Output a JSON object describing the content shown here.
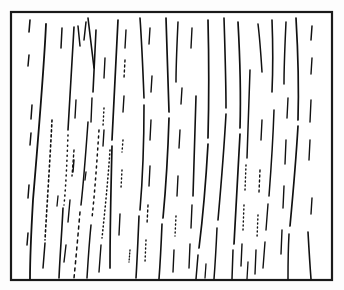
{
  "figure": {
    "kind": "line-drawing",
    "background_color": "#ffffff",
    "ink_color": "#111111",
    "frame_color": "#1a1a1a",
    "canvas": {
      "width": 344,
      "height": 290
    },
    "frame": {
      "x": 11,
      "y": 12,
      "width": 321,
      "height": 268,
      "stroke_width": 2.2
    },
    "stroke_count": 78,
    "caption": "",
    "labels": [],
    "axes": []
  },
  "chart_data": {
    "type": "line",
    "xlabel": "",
    "ylabel": "",
    "xlim": [
      11,
      332
    ],
    "ylim": [
      12,
      280
    ],
    "grid": false,
    "legend": "none",
    "strokes": [
      {
        "d": "M 30 20 L 29 32",
        "w": 1.6,
        "dash": "none"
      },
      {
        "d": "M 29 55 L 28 66",
        "w": 1.5,
        "dash": "none"
      },
      {
        "d": "M 32 105 L 31 119",
        "w": 1.5,
        "dash": "none"
      },
      {
        "d": "M 31 133 L 30 145",
        "w": 1.5,
        "dash": "none"
      },
      {
        "d": "M 29 185 L 28 198",
        "w": 1.5,
        "dash": "none"
      },
      {
        "d": "M 28 233 L 27 245",
        "w": 1.5,
        "dash": "none"
      },
      {
        "d": "M 46 24 C 44 70 38 140 33 200 C 31 235 30 262 30 279",
        "w": 1.8,
        "dash": "none"
      },
      {
        "d": "M 52 120 C 50 160 47 205 45 240",
        "w": 1.6,
        "dash": "2 3"
      },
      {
        "d": "M 45 243 L 43 268",
        "w": 1.5,
        "dash": "none"
      },
      {
        "d": "M 62 28 L 61 48",
        "w": 1.5,
        "dash": "none"
      },
      {
        "d": "M 74 27 C 72 60 70 95 68 130",
        "w": 1.6,
        "dash": "none"
      },
      {
        "d": "M 68 135 C 67 160 66 185 64 205",
        "w": 1.5,
        "dash": "1 4"
      },
      {
        "d": "M 63 208 C 62 230 60 255 59 278",
        "w": 1.6,
        "dash": "none"
      },
      {
        "d": "M 76 100 L 75 118",
        "w": 1.4,
        "dash": "none"
      },
      {
        "d": "M 74 150 L 72 176",
        "w": 1.4,
        "dash": "2 3"
      },
      {
        "d": "M 70 200 L 68 222",
        "w": 1.4,
        "dash": "none"
      },
      {
        "d": "M 66 245 L 64 262",
        "w": 1.4,
        "dash": "none"
      },
      {
        "d": "M 86 22 L 84 40",
        "w": 1.5,
        "dash": "none"
      },
      {
        "d": "M 88 122 C 86 150 84 178 81 205",
        "w": 1.5,
        "dash": "none"
      },
      {
        "d": "M 80 212 C 78 235 76 258 74 278",
        "w": 1.5,
        "dash": "3 4"
      },
      {
        "d": "M 96 30 C 95 52 94 74 93 92",
        "w": 1.6,
        "dash": "none"
      },
      {
        "d": "M 92 98 L 91 122",
        "w": 1.4,
        "dash": "none"
      },
      {
        "d": "M 99 130 C 97 160 95 190 92 218",
        "w": 1.5,
        "dash": "2 4"
      },
      {
        "d": "M 91 225 C 89 245 88 262 87 278",
        "w": 1.5,
        "dash": "none"
      },
      {
        "d": "M 105 58 L 104 78",
        "w": 1.4,
        "dash": "none"
      },
      {
        "d": "M 104 108 L 103 126",
        "w": 1.4,
        "dash": "1 3"
      },
      {
        "d": "M 110 150 C 108 180 105 210 102 238",
        "w": 1.5,
        "dash": "1 3"
      },
      {
        "d": "M 101 245 L 99 272",
        "w": 1.4,
        "dash": "none"
      },
      {
        "d": "M 74 160 L 73 172",
        "w": 1.4,
        "dash": "none"
      },
      {
        "d": "M 78 26 L 80 46",
        "w": 1.5,
        "dash": "none"
      },
      {
        "d": "M 88 18 C 90 35 92 52 94 68",
        "w": 1.6,
        "dash": "none"
      },
      {
        "d": "M 104 130 L 103 146",
        "w": 1.4,
        "dash": "none"
      },
      {
        "d": "M 118 20 C 116 60 114 100 112 140",
        "w": 1.7,
        "dash": "none"
      },
      {
        "d": "M 112 146 C 111 186 110 226 110 268",
        "w": 1.7,
        "dash": "none"
      },
      {
        "d": "M 126 30 L 125 48",
        "w": 1.4,
        "dash": "none"
      },
      {
        "d": "M 125 60 L 124 78",
        "w": 1.4,
        "dash": "2 3"
      },
      {
        "d": "M 124 96 L 123 112",
        "w": 1.4,
        "dash": "none"
      },
      {
        "d": "M 123 140 L 122 152",
        "w": 1.4,
        "dash": "1 3"
      },
      {
        "d": "M 122 170 L 121 188",
        "w": 1.4,
        "dash": "1 3"
      },
      {
        "d": "M 120 214 L 119 235",
        "w": 1.4,
        "dash": "none"
      },
      {
        "d": "M 140 18 C 142 46 143 72 144 98",
        "w": 1.6,
        "dash": "none"
      },
      {
        "d": "M 144 105 C 144 140 143 175 140 210",
        "w": 1.6,
        "dash": "none"
      },
      {
        "d": "M 139 216 C 138 240 137 262 136 278",
        "w": 1.6,
        "dash": "none"
      },
      {
        "d": "M 150 28 L 149 44",
        "w": 1.4,
        "dash": "none"
      },
      {
        "d": "M 152 76 L 151 92",
        "w": 1.4,
        "dash": "none"
      },
      {
        "d": "M 151 120 L 150 140",
        "w": 1.4,
        "dash": "none"
      },
      {
        "d": "M 150 166 L 149 186",
        "w": 1.4,
        "dash": "none"
      },
      {
        "d": "M 148 205 L 147 224",
        "w": 1.4,
        "dash": "2 3"
      },
      {
        "d": "M 146 240 L 145 262",
        "w": 1.4,
        "dash": "1 3"
      },
      {
        "d": "M 166 18 C 167 50 168 82 169 112",
        "w": 1.7,
        "dash": "none"
      },
      {
        "d": "M 169 118 C 168 152 166 186 163 218",
        "w": 1.7,
        "dash": "none"
      },
      {
        "d": "M 162 224 C 161 248 160 266 159 279",
        "w": 1.6,
        "dash": "none"
      },
      {
        "d": "M 178 22 C 177 44 176 64 176 82",
        "w": 1.5,
        "dash": "none"
      },
      {
        "d": "M 182 88 L 181 104",
        "w": 1.4,
        "dash": "none"
      },
      {
        "d": "M 180 130 L 179 148",
        "w": 1.4,
        "dash": "none"
      },
      {
        "d": "M 178 176 L 177 196",
        "w": 1.4,
        "dash": "none"
      },
      {
        "d": "M 176 216 L 175 236",
        "w": 1.4,
        "dash": "1 3"
      },
      {
        "d": "M 174 250 L 173 272",
        "w": 1.4,
        "dash": "none"
      },
      {
        "d": "M 192 28 L 191 48",
        "w": 1.4,
        "dash": "none"
      },
      {
        "d": "M 196 96 C 195 130 194 164 193 196",
        "w": 1.6,
        "dash": "none"
      },
      {
        "d": "M 192 205 L 191 228",
        "w": 1.4,
        "dash": "none"
      },
      {
        "d": "M 190 244 L 189 268",
        "w": 1.4,
        "dash": "none"
      },
      {
        "d": "M 208 20 C 209 60 209 100 208 138",
        "w": 1.7,
        "dash": "none"
      },
      {
        "d": "M 208 144 C 206 180 203 216 199 248",
        "w": 1.7,
        "dash": "none"
      },
      {
        "d": "M 198 255 L 196 279",
        "w": 1.5,
        "dash": "none"
      },
      {
        "d": "M 224 18 C 225 50 226 80 226 108",
        "w": 1.6,
        "dash": "none"
      },
      {
        "d": "M 226 114 C 224 150 221 186 218 220",
        "w": 1.6,
        "dash": "none"
      },
      {
        "d": "M 217 228 C 216 250 215 266 214 279",
        "w": 1.5,
        "dash": "none"
      },
      {
        "d": "M 238 22 C 240 58 241 94 240 128",
        "w": 1.7,
        "dash": "none"
      },
      {
        "d": "M 240 134 C 238 172 236 210 234 244",
        "w": 1.7,
        "dash": "none"
      },
      {
        "d": "M 233 250 L 232 279",
        "w": 1.5,
        "dash": "none"
      },
      {
        "d": "M 250 70 C 249 100 248 130 247 158",
        "w": 1.5,
        "dash": "none"
      },
      {
        "d": "M 246 165 L 245 190",
        "w": 1.4,
        "dash": "1 3"
      },
      {
        "d": "M 244 205 L 243 230",
        "w": 1.4,
        "dash": "1 3"
      },
      {
        "d": "M 242 244 L 241 266",
        "w": 1.4,
        "dash": "none"
      },
      {
        "d": "M 258 24 C 260 40 261 56 262 72",
        "w": 1.5,
        "dash": "none"
      },
      {
        "d": "M 262 120 L 261 140",
        "w": 1.4,
        "dash": "none"
      },
      {
        "d": "M 260 170 L 259 192",
        "w": 1.4,
        "dash": "2 3"
      },
      {
        "d": "M 258 215 L 257 238",
        "w": 1.4,
        "dash": "1 3"
      },
      {
        "d": "M 256 250 L 255 274",
        "w": 1.4,
        "dash": "none"
      },
      {
        "d": "M 272 20 C 273 46 273 70 272 92",
        "w": 1.6,
        "dash": "none"
      },
      {
        "d": "M 274 110 C 273 140 271 170 269 196",
        "w": 1.5,
        "dash": "none"
      },
      {
        "d": "M 268 204 L 266 230",
        "w": 1.4,
        "dash": "none"
      },
      {
        "d": "M 265 242 L 263 268",
        "w": 1.4,
        "dash": "none"
      },
      {
        "d": "M 286 22 C 285 44 284 64 284 84",
        "w": 1.5,
        "dash": "none"
      },
      {
        "d": "M 288 98 L 287 118",
        "w": 1.4,
        "dash": "none"
      },
      {
        "d": "M 286 140 L 285 164",
        "w": 1.4,
        "dash": "none"
      },
      {
        "d": "M 284 186 L 283 208",
        "w": 1.4,
        "dash": "none"
      },
      {
        "d": "M 282 230 L 281 254",
        "w": 1.4,
        "dash": "none"
      },
      {
        "d": "M 296 18 C 298 52 299 86 298 120",
        "w": 1.7,
        "dash": "none"
      },
      {
        "d": "M 298 126 C 296 160 293 194 290 226",
        "w": 1.7,
        "dash": "none"
      },
      {
        "d": "M 289 234 C 288 252 288 266 288 279",
        "w": 1.5,
        "dash": "none"
      },
      {
        "d": "M 312 26 L 311 40",
        "w": 1.5,
        "dash": "none"
      },
      {
        "d": "M 312 58 L 311 74",
        "w": 1.4,
        "dash": "none"
      },
      {
        "d": "M 311 100 L 310 122",
        "w": 1.4,
        "dash": "none"
      },
      {
        "d": "M 310 140 L 309 160",
        "w": 1.4,
        "dash": "none"
      },
      {
        "d": "M 312 198 L 311 214",
        "w": 1.4,
        "dash": "none"
      },
      {
        "d": "M 308 232 C 309 250 310 266 311 279",
        "w": 1.6,
        "dash": "none"
      },
      {
        "d": "M 58 196 L 57 206",
        "w": 1.3,
        "dash": "none"
      },
      {
        "d": "M 86 172 L 85 180",
        "w": 1.3,
        "dash": "none"
      },
      {
        "d": "M 130 250 L 129 262",
        "w": 1.3,
        "dash": "1 2"
      },
      {
        "d": "M 206 264 L 205 278",
        "w": 1.3,
        "dash": "none"
      },
      {
        "d": "M 248 262 L 247 279",
        "w": 1.3,
        "dash": "none"
      }
    ]
  }
}
